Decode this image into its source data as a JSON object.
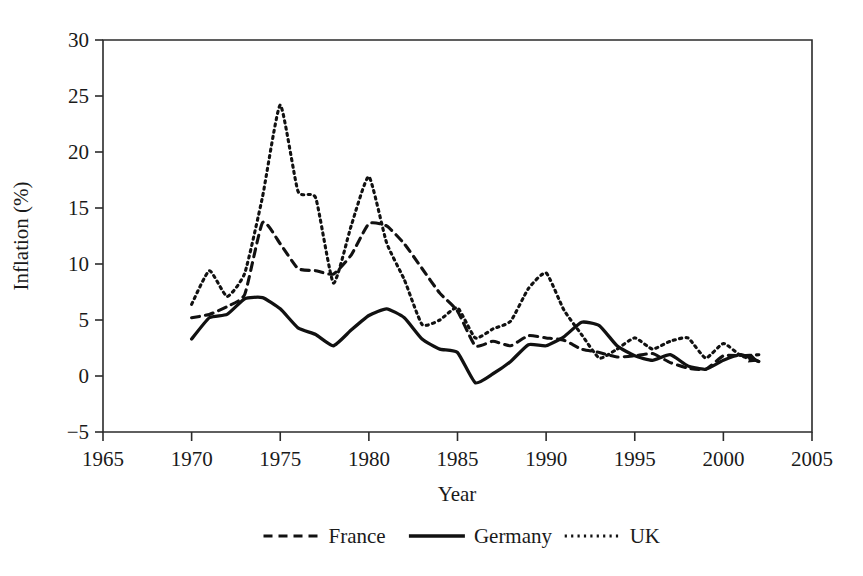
{
  "chart_data": {
    "type": "line",
    "title": "",
    "xlabel": "Year",
    "ylabel": "Inflation (%)",
    "xlim": [
      1965,
      2005
    ],
    "ylim": [
      -5,
      30
    ],
    "xticks": [
      1965,
      1970,
      1975,
      1980,
      1985,
      1990,
      1995,
      2000,
      2005
    ],
    "xtick_labels": [
      "1965",
      "1970",
      "1975",
      "1980",
      "1985",
      "1990",
      "1995",
      "2000",
      "2005"
    ],
    "yticks": [
      -5,
      0,
      5,
      10,
      15,
      20,
      25,
      30
    ],
    "ytick_labels": [
      "−5",
      "0",
      "5",
      "10",
      "15",
      "20",
      "25",
      "30"
    ],
    "grid": false,
    "legend_position": "below-axis-center",
    "x": [
      1970,
      1971,
      1972,
      1973,
      1974,
      1975,
      1976,
      1977,
      1978,
      1979,
      1980,
      1981,
      1982,
      1983,
      1984,
      1985,
      1986,
      1987,
      1988,
      1989,
      1990,
      1991,
      1992,
      1993,
      1994,
      1995,
      1996,
      1997,
      1998,
      1999,
      2000,
      2001,
      2002
    ],
    "series": [
      {
        "name": "France",
        "style": "dashed",
        "color": "#111111",
        "values": [
          5.2,
          5.5,
          6.2,
          7.3,
          13.7,
          11.8,
          9.6,
          9.4,
          9.1,
          10.8,
          13.6,
          13.4,
          11.8,
          9.6,
          7.4,
          5.8,
          2.7,
          3.1,
          2.7,
          3.6,
          3.4,
          3.2,
          2.4,
          2.1,
          1.7,
          1.8,
          2.0,
          1.2,
          0.7,
          0.6,
          1.8,
          1.8,
          1.9
        ]
      },
      {
        "name": "Germany",
        "style": "solid",
        "color": "#111111",
        "values": [
          3.3,
          5.2,
          5.5,
          6.9,
          7.0,
          6.0,
          4.3,
          3.7,
          2.7,
          4.1,
          5.4,
          6.0,
          5.2,
          3.3,
          2.4,
          2.1,
          -0.6,
          0.2,
          1.3,
          2.8,
          2.7,
          3.5,
          4.8,
          4.5,
          2.7,
          1.8,
          1.4,
          1.9,
          0.9,
          0.6,
          1.4,
          1.9,
          1.3
        ]
      },
      {
        "name": "UK",
        "style": "dotted",
        "color": "#111111",
        "values": [
          6.4,
          9.4,
          7.1,
          9.2,
          16.0,
          24.2,
          16.5,
          15.9,
          8.3,
          13.4,
          17.8,
          11.9,
          8.6,
          4.6,
          5.0,
          6.1,
          3.4,
          4.2,
          4.9,
          7.8,
          9.2,
          5.9,
          3.7,
          1.6,
          2.4,
          3.4,
          2.4,
          3.1,
          3.4,
          1.6,
          2.9,
          1.8,
          1.3
        ]
      }
    ],
    "legend": [
      {
        "label": "France",
        "style": "dashed"
      },
      {
        "label": "Germany",
        "style": "solid"
      },
      {
        "label": "UK",
        "style": "dotted"
      }
    ]
  }
}
